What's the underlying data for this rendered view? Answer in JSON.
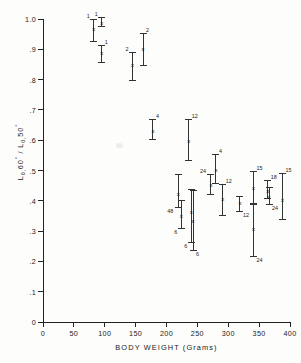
{
  "figure": {
    "background": "#fdfdfc",
    "ink_color": "#222222"
  },
  "chart_data": {
    "type": "scatter",
    "title": "",
    "subtitle": "",
    "xlabel": "BODY WEIGHT (Grams)",
    "ylabel": "L 0,60° / L 0,50°",
    "ylabel_parts": {
      "prefix1": "L",
      "sub1": "0,",
      "value1": "60",
      "deg1": "°",
      "separator": " / ",
      "prefix2": "L",
      "sub2": "0,",
      "value2": "50",
      "deg2": "°"
    },
    "xlim": [
      0,
      400
    ],
    "ylim": [
      0,
      1.0
    ],
    "xticks": [
      0,
      50,
      100,
      150,
      200,
      250,
      300,
      350,
      400
    ],
    "xtick_labels": [
      "0",
      "50",
      "100",
      "150",
      "200",
      "250",
      "300",
      "350",
      "400"
    ],
    "yticks": [
      0,
      0.1,
      0.2,
      0.3,
      0.4,
      0.5,
      0.6,
      0.7,
      0.8,
      0.9,
      1.0
    ],
    "ytick_labels": [
      "0",
      ".1",
      ".2",
      ".3",
      ".4",
      ".5",
      ".6",
      ".7",
      ".8",
      ".9",
      "1.0"
    ],
    "grid": false,
    "legend": false,
    "marker_symbol": "x",
    "error_bar_style": "range-with-caps",
    "n_label_note": "numbers adjacent to error bars are sample sizes (n)",
    "points": [
      {
        "x": 82,
        "y": 0.965,
        "low": 0.925,
        "high": 1.0,
        "n": "1",
        "n_pos": "top-left"
      },
      {
        "x": 95,
        "y": 0.985,
        "low": 0.975,
        "high": 1.005,
        "n": "1",
        "n_pos": "top-left"
      },
      {
        "x": 95,
        "y": 0.885,
        "low": 0.855,
        "high": 0.915,
        "n": "1",
        "n_pos": "top-right"
      },
      {
        "x": 145,
        "y": 0.845,
        "low": 0.795,
        "high": 0.89,
        "n": "2",
        "n_pos": "top-left"
      },
      {
        "x": 162,
        "y": 0.9,
        "low": 0.845,
        "high": 0.955,
        "n": "2",
        "n_pos": "top-right"
      },
      {
        "x": 178,
        "y": 0.63,
        "low": 0.6,
        "high": 0.67,
        "n": "4",
        "n_pos": "top-right"
      },
      {
        "x": 236,
        "y": 0.597,
        "low": 0.53,
        "high": 0.67,
        "n": "12",
        "n_pos": "top-right"
      },
      {
        "x": 280,
        "y": 0.5,
        "low": 0.455,
        "high": 0.555,
        "n": "4",
        "n_pos": "top-right"
      },
      {
        "x": 272,
        "y": 0.45,
        "low": 0.42,
        "high": 0.49,
        "n": "24",
        "n_pos": "top-left"
      },
      {
        "x": 291,
        "y": 0.405,
        "low": 0.35,
        "high": 0.455,
        "n": "12",
        "n_pos": "top-right"
      },
      {
        "x": 219,
        "y": 0.422,
        "low": 0.375,
        "high": 0.487,
        "n": "48",
        "n_pos": "bottom-left"
      },
      {
        "x": 224,
        "y": 0.348,
        "low": 0.308,
        "high": 0.403,
        "n": "6",
        "n_pos": "bottom-left"
      },
      {
        "x": 240,
        "y": 0.362,
        "low": 0.262,
        "high": 0.44,
        "n": "6",
        "n_pos": "bottom-left"
      },
      {
        "x": 243,
        "y": 0.33,
        "low": 0.235,
        "high": 0.437,
        "n": "6",
        "n_pos": "bottom-right"
      },
      {
        "x": 319,
        "y": 0.392,
        "low": 0.362,
        "high": 0.415,
        "n": "12",
        "n_pos": "bottom-right"
      },
      {
        "x": 341,
        "y": 0.44,
        "low": 0.385,
        "high": 0.5,
        "n": "15",
        "n_pos": "top-right"
      },
      {
        "x": 341,
        "y": 0.305,
        "low": 0.213,
        "high": 0.392,
        "n": "24",
        "n_pos": "bottom-right"
      },
      {
        "x": 364,
        "y": 0.432,
        "low": 0.405,
        "high": 0.47,
        "n": "18",
        "n_pos": "top-right"
      },
      {
        "x": 366,
        "y": 0.412,
        "low": 0.385,
        "high": 0.445,
        "n": "24",
        "n_pos": "bottom-right"
      },
      {
        "x": 388,
        "y": 0.4,
        "low": 0.338,
        "high": 0.492,
        "n": "15",
        "n_pos": "top-right"
      }
    ]
  }
}
